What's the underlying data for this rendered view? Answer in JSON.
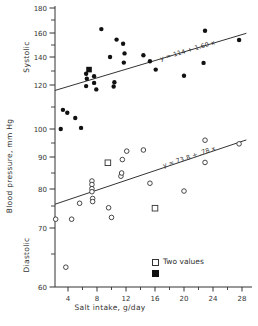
{
  "chart_data": {
    "type": "scatter",
    "xlabel": "Salt intake, g/day",
    "ylabel": "Blood pressure, mm Hg",
    "y_section_labels": [
      "Systolic",
      "Diastolic"
    ],
    "x_ticks_major": [
      4,
      8,
      12,
      16,
      20,
      24,
      28
    ],
    "x_ticks_minor": [
      6,
      10,
      14,
      18,
      22,
      26
    ],
    "y_ticks_major": [
      180,
      160,
      140,
      120,
      100,
      90,
      80,
      70,
      60
    ],
    "y_ticks_minor": [
      170,
      150,
      130,
      110,
      95,
      85,
      75,
      65
    ],
    "y_axis_note": "broken non-linear scale: systolic section 120-180 compressed, diastolic section 60-100 expanded",
    "grid": false,
    "line_x_range": [
      2.2,
      28.6
    ],
    "series": [
      {
        "name": "systolic",
        "marker": "filled-circle",
        "points": [
          [
            3.3,
            108.7
          ],
          [
            3.9,
            107.4
          ],
          [
            5.0,
            105.0
          ],
          [
            3.0,
            100.0
          ],
          [
            5.8,
            100.5
          ],
          [
            6.5,
            128.0
          ],
          [
            7.6,
            126.3
          ],
          [
            6.6,
            124.5
          ],
          [
            7.6,
            121.5
          ],
          [
            6.5,
            119.5
          ],
          [
            7.9,
            118.0
          ],
          [
            10.4,
            122.0
          ],
          [
            10.3,
            119.3
          ],
          [
            8.6,
            163.0
          ],
          [
            10.7,
            154.5
          ],
          [
            11.6,
            151.0
          ],
          [
            11.8,
            143.0
          ],
          [
            9.8,
            140.0
          ],
          [
            11.7,
            136.0
          ],
          [
            14.4,
            141.5
          ],
          [
            15.3,
            137.0
          ],
          [
            16.1,
            131.0
          ],
          [
            20.0,
            126.6
          ],
          [
            22.7,
            135.8
          ],
          [
            22.9,
            161.7
          ],
          [
            27.6,
            154.2
          ]
        ]
      },
      {
        "name": "systolic-two-values",
        "marker": "filled-square",
        "points": [
          [
            6.9,
            131.0
          ]
        ]
      },
      {
        "name": "diastolic",
        "marker": "open-circle",
        "points": [
          [
            2.3,
            72.0
          ],
          [
            4.5,
            72.0
          ],
          [
            3.7,
            63.0
          ],
          [
            5.6,
            75.8
          ],
          [
            7.3,
            82.5
          ],
          [
            7.3,
            81.4
          ],
          [
            7.3,
            80.1
          ],
          [
            7.3,
            79.2
          ],
          [
            7.4,
            77.2
          ],
          [
            7.4,
            76.3
          ],
          [
            9.6,
            74.6
          ],
          [
            10.0,
            72.4
          ],
          [
            11.3,
            84.0
          ],
          [
            11.4,
            85.0
          ],
          [
            11.5,
            89.2
          ],
          [
            12.1,
            92.1
          ],
          [
            14.4,
            92.5
          ],
          [
            15.3,
            81.8
          ],
          [
            20.0,
            79.4
          ],
          [
            22.9,
            96.0
          ],
          [
            22.9,
            88.3
          ],
          [
            27.6,
            94.7
          ]
        ]
      },
      {
        "name": "diastolic-two-values",
        "marker": "open-square",
        "points": [
          [
            9.5,
            88.2
          ],
          [
            16.0,
            74.5
          ]
        ]
      }
    ],
    "regressions": [
      {
        "series": "systolic",
        "label": "y = 114 + 1.60 x",
        "intercept": 114,
        "slope": 1.6
      },
      {
        "series": "diastolic",
        "label": "y = 73.8 + .78 x",
        "intercept": 73.8,
        "slope": 0.78
      }
    ],
    "legend": {
      "label": "Two values",
      "items": [
        {
          "marker": "open-square"
        },
        {
          "marker": "filled-square"
        }
      ]
    },
    "colors": {
      "ink": "#333333",
      "marker": "#111111",
      "background": "#ffffff"
    }
  }
}
